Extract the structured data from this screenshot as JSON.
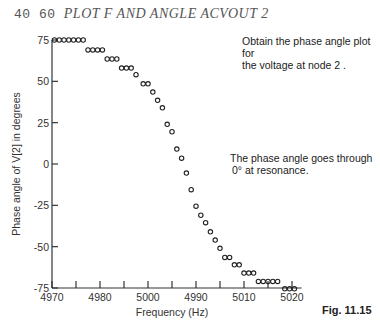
{
  "command": {
    "numbers": "40 60 ",
    "text": "PLOT F AND ANGLE ACVOUT 2"
  },
  "annotations": {
    "top": [
      "Obtain the phase angle plot for",
      "the voltage at node 2 ."
    ],
    "middle": [
      "The phase angle goes through",
      "0° at resonance."
    ]
  },
  "figure_label": "Fig. 11.15",
  "chart_data": {
    "type": "scatter",
    "title": "",
    "xlabel": "Frequency (Hz)",
    "ylabel": "Phase angle of V[2] in degrees",
    "xlim": [
      4970,
      5022
    ],
    "ylim": [
      -75,
      75
    ],
    "x_ticks": [
      4970,
      4975,
      4980,
      4985,
      4990,
      4995,
      5000,
      5005,
      5010,
      5015,
      5020
    ],
    "x_tick_labels": [
      {
        "value": 4970,
        "label": "4970"
      },
      {
        "value": 4980,
        "label": "4980"
      },
      {
        "value": 4990,
        "label": "5000"
      },
      {
        "value": 5000,
        "label": "4990"
      },
      {
        "value": 5010,
        "label": "5010"
      },
      {
        "value": 5020,
        "label": "5020"
      }
    ],
    "y_ticks": [
      75,
      50,
      25,
      0,
      -25,
      -50,
      -75
    ],
    "y_tick_labels": [
      "75",
      "50",
      "25",
      "0",
      "-25",
      "-50",
      "-75"
    ],
    "marker": "o",
    "grid": false,
    "points": [
      [
        4970.5,
        75
      ],
      [
        4971.5,
        75
      ],
      [
        4972.5,
        75
      ],
      [
        4973.5,
        75
      ],
      [
        4974.5,
        75
      ],
      [
        4975.5,
        75
      ],
      [
        4976.5,
        75
      ],
      [
        4977.5,
        69
      ],
      [
        4978.5,
        69
      ],
      [
        4979.5,
        69
      ],
      [
        4980.5,
        69
      ],
      [
        4981.5,
        63.5
      ],
      [
        4982.5,
        63.5
      ],
      [
        4983.5,
        63.5
      ],
      [
        4984.5,
        58
      ],
      [
        4985.5,
        58
      ],
      [
        4986.5,
        58
      ],
      [
        4987.5,
        54
      ],
      [
        4989,
        48.5
      ],
      [
        4990,
        48.5
      ],
      [
        4991,
        43.5
      ],
      [
        4992,
        38.5
      ],
      [
        4993,
        34
      ],
      [
        4994,
        24
      ],
      [
        4995,
        19.5
      ],
      [
        4996,
        9
      ],
      [
        4997,
        3.5
      ],
      [
        4998,
        -5.5
      ],
      [
        4999,
        -15.5
      ],
      [
        5000,
        -25.5
      ],
      [
        5001,
        -31
      ],
      [
        5002,
        -35.5
      ],
      [
        5003,
        -41
      ],
      [
        5004,
        -46
      ],
      [
        5005,
        -51
      ],
      [
        5006,
        -56.5
      ],
      [
        5007,
        -56.5
      ],
      [
        5008,
        -61
      ],
      [
        5009,
        -61
      ],
      [
        5010,
        -66
      ],
      [
        5011,
        -66
      ],
      [
        5012,
        -66
      ],
      [
        5013,
        -71
      ],
      [
        5014,
        -71
      ],
      [
        5015,
        -71
      ],
      [
        5016,
        -71
      ],
      [
        5017,
        -71
      ],
      [
        5018.5,
        -75.5
      ],
      [
        5019.5,
        -75.5
      ],
      [
        5020.5,
        -75.5
      ]
    ]
  }
}
